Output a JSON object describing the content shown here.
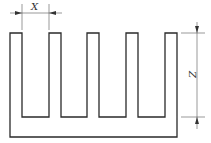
{
  "diagram": {
    "type": "heat-sink cross-section with dimensions",
    "fin_count": 5,
    "dimensions": {
      "pitch_label": "X",
      "height_label": "Z"
    },
    "colors": {
      "stroke": "#2a2a2a",
      "background": "#ffffff"
    }
  }
}
